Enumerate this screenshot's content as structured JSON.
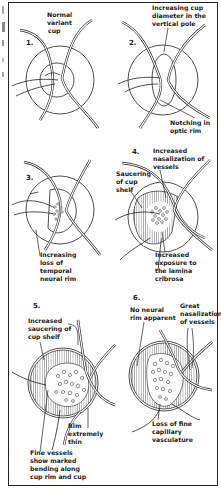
{
  "figure": {
    "panels": [
      {
        "number": "1.",
        "labels": [
          "Normal",
          "variant",
          "cup"
        ]
      },
      {
        "number": "2.",
        "labels": [
          "Increasing cup",
          "diameter in the",
          "vertical pole",
          "Notching in",
          "optic rim"
        ]
      },
      {
        "number": "3.",
        "labels": [
          "Increasing",
          "loss of",
          "temporal",
          "neural rim"
        ]
      },
      {
        "number": "4.",
        "labels": [
          "Increased",
          "nasalization of",
          "vessels",
          "Saucering",
          "of cup",
          "shelf",
          "Increased",
          "exposure to",
          "the lamina",
          "cribrosa"
        ]
      },
      {
        "number": "5.",
        "labels": [
          "Increased",
          "saucering of",
          "cup shelf",
          "Rim",
          "extremely",
          "thin",
          "Fine vessels",
          "show marked",
          "bending along",
          "cup rim and cup"
        ]
      },
      {
        "number": "6.",
        "labels": [
          "No neural",
          "rim apparent",
          "Great",
          "nasalization",
          "of vessels",
          "Loss of fine",
          "capillary",
          "vasculature"
        ]
      }
    ]
  },
  "colors": {
    "ink": "#1a1a1a",
    "background": "#ffffff"
  }
}
